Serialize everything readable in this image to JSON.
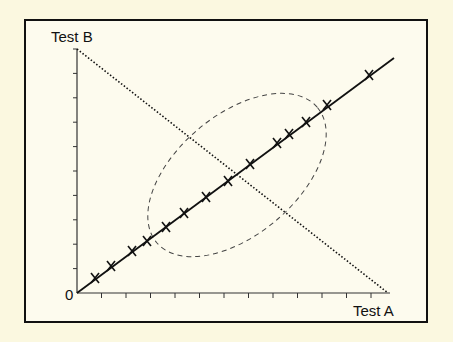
{
  "diagram": {
    "y_axis_label": "Test B",
    "x_axis_label": "Test A",
    "origin_label": "0",
    "colors": {
      "background": "#fbf8e0",
      "ink": "#111111"
    },
    "axes": {
      "origin": [
        77,
        293
      ],
      "y_top": 49,
      "x_right": 390,
      "tick_count": 12
    },
    "identity_line": {
      "from": [
        77,
        293
      ],
      "to": [
        394,
        58
      ],
      "style": "solid"
    },
    "disagreement_line": {
      "from": [
        77,
        49
      ],
      "to": [
        388,
        293
      ],
      "style": "dotted"
    },
    "ellipse": {
      "cx": 237,
      "cy": 175,
      "rx": 105,
      "ry": 60,
      "rotation": -40,
      "style": "dashed"
    },
    "markers": [
      [
        95,
        278
      ],
      [
        111,
        266
      ],
      [
        132,
        251
      ],
      [
        147,
        241
      ],
      [
        166,
        227
      ],
      [
        184,
        213
      ],
      [
        206,
        197
      ],
      [
        228,
        181
      ],
      [
        250,
        164
      ],
      [
        277,
        143
      ],
      [
        289,
        134
      ],
      [
        306,
        122
      ],
      [
        327,
        105
      ],
      [
        369,
        75
      ]
    ]
  }
}
